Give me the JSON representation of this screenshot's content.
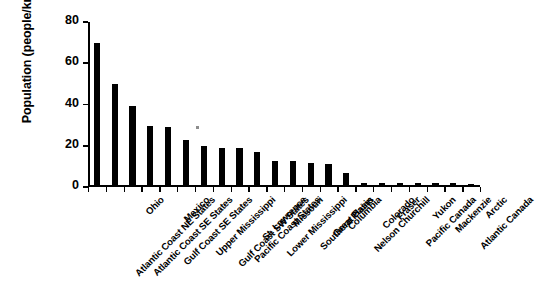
{
  "chart_data": {
    "type": "bar",
    "title": "",
    "xlabel": "",
    "ylabel": "Population (people/km²)",
    "ylabel_text": "Population (people/km",
    "ylabel_sup": "2",
    "ylabel_close": ")",
    "ylim": [
      0,
      80
    ],
    "yticks": [
      0,
      20,
      40,
      60,
      80
    ],
    "ytick_labels": [
      "0",
      "20",
      "40",
      "60",
      "80"
    ],
    "grid": false,
    "legend": false,
    "bar_color": "#000000",
    "categories": [
      "Atlantic Coast NE States",
      "Atlantic Coast SE States",
      "Ohio",
      "Gulf Coast SE States",
      "Mexico",
      "Upper Mississippi",
      "Gulf Coast SW States",
      "Pacific Coast States",
      "St. Lawrence",
      "Lower Mississippi",
      "Missouri",
      "Southern Plains",
      "Great Basin",
      "Columbia",
      "Nelson Churchill",
      "Colorado",
      "Fraser",
      "Pacific Canada",
      "Yukon",
      "Mackenzie",
      "Atlantic Canada",
      "Arctic"
    ],
    "values": [
      69,
      49,
      38.5,
      29,
      28.5,
      22,
      19,
      18,
      18,
      16,
      12,
      12,
      11,
      10.5,
      6,
      1.2,
      1.2,
      1,
      1,
      1,
      1,
      0.2
    ]
  }
}
